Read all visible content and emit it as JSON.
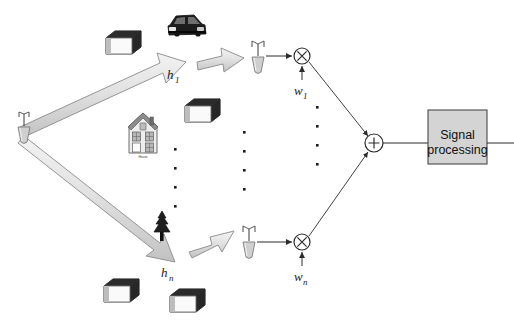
{
  "figure": {
    "background": "#ffffff",
    "line_color": "#3d3d3d",
    "fill_light": "#dcdcdc",
    "fill_mid": "#b4b4b4",
    "fill_dark": "#2b2b2b",
    "box_fill": "#d4d4d4"
  },
  "labels": {
    "h_first": {
      "base": "h",
      "sub": "1"
    },
    "h_last": {
      "base": "h",
      "sub": "n"
    },
    "w_first": {
      "base": "w",
      "sub": "1"
    },
    "w_last": {
      "base": "w",
      "sub": "n"
    },
    "house_caption": "House",
    "multiply_symbol": "×",
    "sum_symbol": "+"
  },
  "processing_box": {
    "line1": "Signal",
    "line2": "processing"
  },
  "icons": {
    "transmitter": "transmit-antenna-icon",
    "receiver_top": "receive-antenna-icon",
    "receiver_bottom": "receive-antenna-icon",
    "building": "building-icon",
    "car": "car-icon",
    "house": "house-icon",
    "tree": "tree-icon",
    "multiplier": "multiplier-node-icon",
    "summer": "summing-node-icon",
    "path_arrow": "block-arrow-icon",
    "vertical_ellipsis": "vertical-ellipsis-icon"
  },
  "ellipses": {
    "column_one_dots": 4,
    "column_two_dots": 4,
    "column_three_dots": 4
  }
}
